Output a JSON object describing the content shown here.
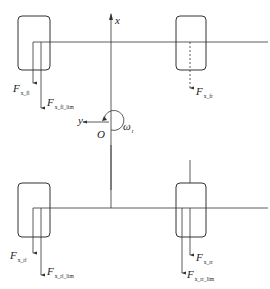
{
  "diagram": {
    "type": "vehicle-tire-force-schematic",
    "axes": {
      "x_label": "x",
      "y_label": "y",
      "origin_label": "O",
      "yaw_rate_label": "ω",
      "yaw_rate_sub": "r"
    },
    "wheels": [
      {
        "id": "fl",
        "position": "front-left",
        "force": {
          "main": "F",
          "sub": "x_fl"
        },
        "force_lim": {
          "main": "F",
          "sub": "x_fl_lim"
        }
      },
      {
        "id": "fr",
        "position": "front-right",
        "force": {
          "main": "F",
          "sub": "x_fr"
        }
      },
      {
        "id": "rl",
        "position": "rear-left",
        "force": {
          "main": "F",
          "sub": "x_rl"
        },
        "force_lim": {
          "main": "F",
          "sub": "x_rl_lim"
        }
      },
      {
        "id": "rr",
        "position": "rear-right",
        "force": {
          "main": "F",
          "sub": "x_rr"
        },
        "force_lim": {
          "main": "F",
          "sub": "x_rr_lim"
        }
      }
    ],
    "colors": {
      "line": "#333333",
      "background": "#ffffff"
    }
  }
}
